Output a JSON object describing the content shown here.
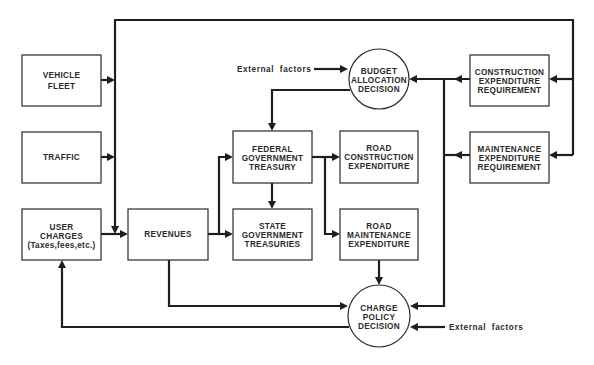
{
  "diagram": {
    "nodes": {
      "vehicle_fleet": [
        "VEHICLE",
        "FLEET"
      ],
      "traffic": [
        "TRAFFIC"
      ],
      "user_charges": [
        "USER",
        "CHARGES",
        "(Taxes,fees,etc.)"
      ],
      "revenues": [
        "REVENUES"
      ],
      "federal_treasury": [
        "FEDERAL",
        "GOVERNMENT",
        "TREASURY"
      ],
      "state_treasuries": [
        "STATE",
        "GOVERNMENT",
        "TREASURIES"
      ],
      "road_construction": [
        "ROAD",
        "CONSTRUCTION",
        "EXPENDITURE"
      ],
      "road_maintenance": [
        "ROAD",
        "MAINTENANCE",
        "EXPENDITURE"
      ],
      "construction_requirement": [
        "CONSTRUCTION",
        "EXPENDITURE",
        "REQUIREMENT"
      ],
      "maintenance_requirement": [
        "MAINTENANCE",
        "EXPENDITURE",
        "REQUIREMENT"
      ],
      "budget_decision": [
        "BUDGET",
        "ALLOCATION",
        "DECISION"
      ],
      "charge_decision": [
        "CHARGE",
        "POLICY",
        "DECISION"
      ]
    },
    "external_top": "External  factors",
    "external_bottom": "External  factors",
    "edges": [
      {
        "from": "vehicle_fleet",
        "to": "revenues"
      },
      {
        "from": "traffic",
        "to": "revenues"
      },
      {
        "from": "user_charges",
        "to": "revenues"
      },
      {
        "from": "revenues",
        "to": "federal_treasury"
      },
      {
        "from": "revenues",
        "to": "state_treasuries"
      },
      {
        "from": "revenues",
        "to": "charge_decision"
      },
      {
        "from": "federal_treasury",
        "to": "state_treasuries"
      },
      {
        "from": "federal_treasury",
        "to": "road_construction"
      },
      {
        "from": "federal_treasury",
        "to": "road_maintenance"
      },
      {
        "from": "budget_decision",
        "to": "federal_treasury"
      },
      {
        "from": "construction_requirement",
        "to": "budget_decision"
      },
      {
        "from": "maintenance_requirement",
        "to": "budget_decision"
      },
      {
        "from": "construction_requirement",
        "to": "charge_decision"
      },
      {
        "from": "road_maintenance",
        "to": "charge_decision"
      },
      {
        "from": "charge_decision",
        "to": "user_charges"
      },
      {
        "from": "external_factors",
        "to": "budget_decision"
      },
      {
        "from": "external_factors",
        "to": "charge_decision"
      },
      {
        "from": "feedback_loop_top",
        "to": "construction_requirement"
      },
      {
        "from": "feedback_loop_top",
        "to": "maintenance_requirement"
      }
    ]
  }
}
